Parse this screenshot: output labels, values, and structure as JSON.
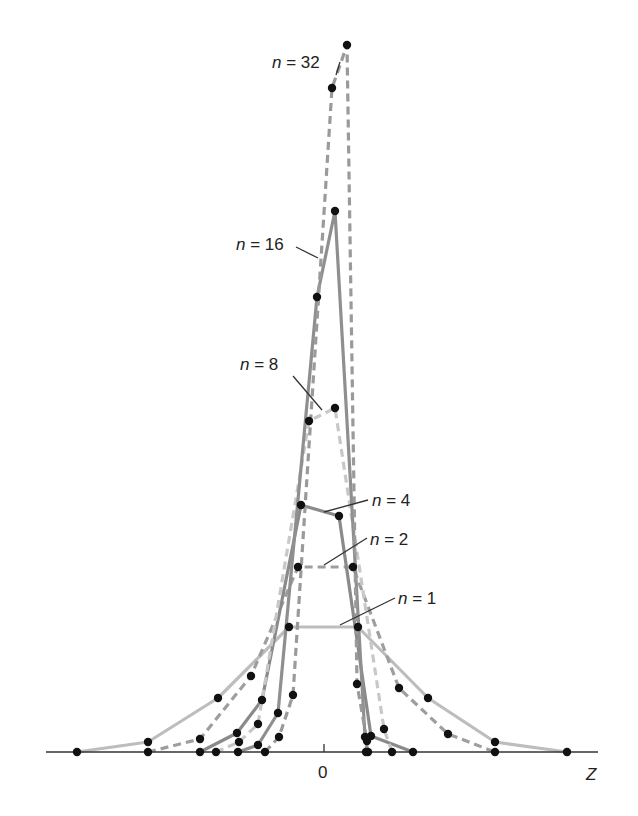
{
  "chart_data": {
    "type": "line",
    "title": "",
    "xlabel": "Z",
    "ylabel": "",
    "x_ticks": [
      "0"
    ],
    "grid": false,
    "legend": "inline labels",
    "series": [
      {
        "name": "n = 1",
        "label_n": "n",
        "label_rest": " = 1",
        "color": "#bdbdbd",
        "dash": "",
        "points": [
          [
            77,
            752
          ],
          [
            148,
            742
          ],
          [
            218,
            698
          ],
          [
            289,
            627
          ],
          [
            358,
            627
          ],
          [
            428,
            698
          ],
          [
            495,
            742
          ],
          [
            567,
            752
          ]
        ],
        "label_pos": [
          398,
          604
        ],
        "leader": [
          [
            395,
            598
          ],
          [
            340,
            625
          ]
        ]
      },
      {
        "name": "n = 2",
        "label_n": "n",
        "label_rest": " = 2",
        "color": "#9e9e9e",
        "dash": "8,5",
        "points": [
          [
            148,
            752
          ],
          [
            200,
            739
          ],
          [
            251,
            676
          ],
          [
            298,
            567
          ],
          [
            353,
            567
          ],
          [
            399,
            688
          ],
          [
            448,
            734
          ],
          [
            495,
            752
          ]
        ],
        "label_pos": [
          370,
          545
        ],
        "leader": [
          [
            367,
            538
          ],
          [
            324,
            565
          ]
        ]
      },
      {
        "name": "n = 4",
        "label_n": "n",
        "label_rest": " = 4",
        "color": "#8a8a8a",
        "dash": "",
        "points": [
          [
            200,
            752
          ],
          [
            237,
            733
          ],
          [
            262,
            700
          ],
          [
            301,
            505
          ],
          [
            339,
            516
          ],
          [
            371,
            736
          ],
          [
            413,
            752
          ]
        ],
        "label_pos": [
          372,
          506
        ],
        "leader": [
          [
            368,
            500
          ],
          [
            324,
            512
          ]
        ]
      },
      {
        "name": "n = 8",
        "label_n": "n",
        "label_rest": " = 8",
        "color": "#c8c8c8",
        "dash": "8,5",
        "points": [
          [
            216,
            752
          ],
          [
            239,
            742
          ],
          [
            258,
            724
          ],
          [
            309,
            421
          ],
          [
            335,
            408
          ],
          [
            384,
            729
          ],
          [
            392,
            752
          ]
        ],
        "label_pos": [
          240,
          370
        ],
        "leader": [
          [
            293,
            376
          ],
          [
            322,
            410
          ]
        ]
      },
      {
        "name": "n = 16",
        "label_n": "n",
        "label_rest": " = 16",
        "color": "#8f8f8f",
        "dash": "",
        "points": [
          [
            238,
            752
          ],
          [
            258,
            745
          ],
          [
            278,
            713
          ],
          [
            317,
            297
          ],
          [
            335,
            211
          ],
          [
            365,
            737
          ],
          [
            368,
            752
          ]
        ],
        "label_pos": [
          236,
          250
        ],
        "leader": [
          [
            296,
            247
          ],
          [
            318,
            258
          ]
        ]
      },
      {
        "name": "n = 32",
        "label_n": "n",
        "label_rest": " = 32",
        "color": "#9a9a9a",
        "dash": "8,5",
        "points": [
          [
            265,
            752
          ],
          [
            279,
            737
          ],
          [
            293,
            695
          ],
          [
            332,
            88
          ],
          [
            347,
            45
          ],
          [
            357,
            684
          ],
          [
            367,
            741
          ],
          [
            366,
            752
          ]
        ],
        "label_pos": [
          272,
          68
        ],
        "leader": [
          [
            336,
            75
          ],
          [
            340,
            62
          ]
        ]
      }
    ],
    "axis": {
      "y": 752,
      "x0": 324,
      "x_start": 46,
      "x_end": 598
    }
  }
}
